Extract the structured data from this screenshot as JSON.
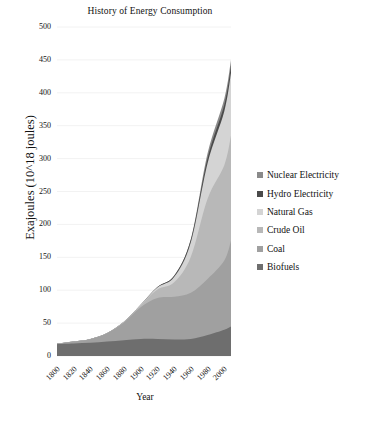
{
  "chart_data": {
    "type": "area",
    "stacked": true,
    "title": "History of Energy Consumption",
    "xlabel": "Year",
    "ylabel": "Exajoules (10^18 joules)",
    "xlim": [
      1800,
      2008
    ],
    "ylim": [
      0,
      500
    ],
    "ytick_labels": [
      "0",
      "50",
      "100",
      "150",
      "200",
      "250",
      "300",
      "350",
      "400",
      "450",
      "500"
    ],
    "ytick_values": [
      0,
      50,
      100,
      150,
      200,
      250,
      300,
      350,
      400,
      450,
      500
    ],
    "xtick_labels": [
      "1800",
      "1820",
      "1840",
      "1860",
      "1880",
      "1900",
      "1920",
      "1940",
      "1960",
      "1980",
      "2000"
    ],
    "xtick_values": [
      1800,
      1820,
      1840,
      1860,
      1880,
      1900,
      1920,
      1940,
      1960,
      1980,
      2000
    ],
    "grid": true,
    "grid_axis": "y",
    "legend_position": "right",
    "x": [
      1800,
      1820,
      1840,
      1860,
      1880,
      1900,
      1920,
      1940,
      1960,
      1980,
      2000,
      2008
    ],
    "series": [
      {
        "name": "Biofuels",
        "color": "#6e6e6e",
        "values": [
          18,
          19,
          20,
          22,
          24,
          26,
          26,
          25,
          26,
          32,
          40,
          45
        ]
      },
      {
        "name": "Coal",
        "color": "#a0a0a0",
        "values": [
          1,
          3,
          6,
          13,
          27,
          48,
          62,
          65,
          70,
          85,
          105,
          130
        ]
      },
      {
        "name": "Crude Oil",
        "color": "#b8b8b8",
        "values": [
          0,
          0,
          0,
          0,
          1,
          3,
          13,
          22,
          55,
          122,
          145,
          160
        ]
      },
      {
        "name": "Natural Gas",
        "color": "#d4d4d4",
        "values": [
          0,
          0,
          0,
          0,
          0,
          1,
          3,
          8,
          22,
          54,
          82,
          95
        ]
      },
      {
        "name": "Hydro Electricity",
        "color": "#4a4a4a",
        "values": [
          0,
          0,
          0,
          0,
          0,
          0,
          1,
          2,
          4,
          8,
          10,
          11
        ]
      },
      {
        "name": "Nuclear Electricity",
        "color": "#8a8a8a",
        "values": [
          0,
          0,
          0,
          0,
          0,
          0,
          0,
          0,
          1,
          7,
          9,
          9
        ]
      }
    ]
  },
  "legend": {
    "items": [
      {
        "label": "Nuclear Electricity",
        "color": "#8a8a8a"
      },
      {
        "label": "Hydro Electricity",
        "color": "#4a4a4a"
      },
      {
        "label": "Natural Gas",
        "color": "#d4d4d4"
      },
      {
        "label": "Crude Oil",
        "color": "#b8b8b8"
      },
      {
        "label": "Coal",
        "color": "#a0a0a0"
      },
      {
        "label": "Biofuels",
        "color": "#6e6e6e"
      }
    ]
  },
  "axes": {
    "grid_color": "#f2f2f2",
    "text_color": "#111111"
  }
}
